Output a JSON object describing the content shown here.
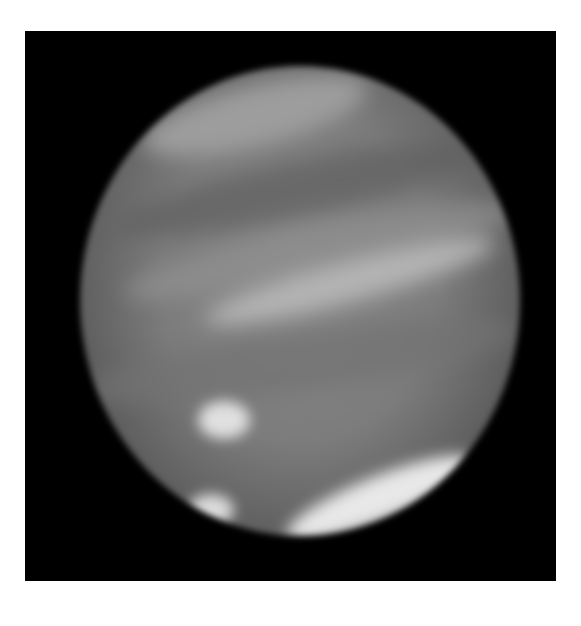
{
  "image": {
    "subject": "Jupiter",
    "description": "Grayscale telescope image of Jupiter showing cloud bands and bright spots",
    "background_color": "#ffffff",
    "frame_color": "#000000",
    "colors": {
      "planet_base": "#7c7c7c",
      "band_light": "#b4b4b4",
      "band_dark": "#5a5a5a",
      "spot_bright": "#e8e8e8"
    },
    "features": [
      {
        "name": "north-polar-bright-arc",
        "type": "band"
      },
      {
        "name": "dark-north-belt",
        "type": "band"
      },
      {
        "name": "bright-equatorial-zone",
        "type": "band"
      },
      {
        "name": "bright-spot-center-left",
        "type": "spot"
      },
      {
        "name": "bright-spot-lower-left",
        "type": "spot"
      },
      {
        "name": "bright-south-arc",
        "type": "band"
      }
    ]
  }
}
